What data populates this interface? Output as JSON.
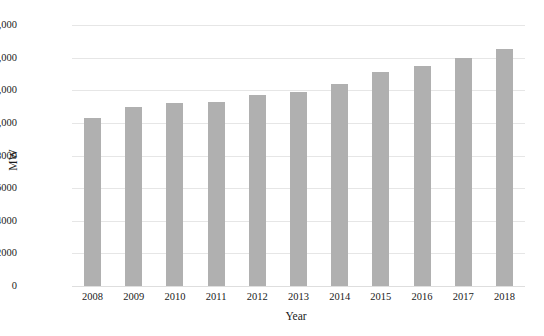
{
  "chart_data": {
    "type": "bar",
    "title": "",
    "xlabel": "Year",
    "ylabel": "MW",
    "categories": [
      "2008",
      "2009",
      "2010",
      "2011",
      "2012",
      "2013",
      "2014",
      "2015",
      "2016",
      "2017",
      "2018"
    ],
    "values": [
      10300,
      11000,
      11200,
      11300,
      11700,
      11900,
      12400,
      13100,
      13500,
      14000,
      14500
    ],
    "series": [
      {
        "name": "MW",
        "values": [
          10300,
          11000,
          11200,
          11300,
          11700,
          11900,
          12400,
          13100,
          13500,
          14000,
          14500
        ]
      }
    ],
    "ylim": [
      0,
      16000
    ],
    "y_ticks": [
      0,
      2000,
      4000,
      6000,
      8000,
      10000,
      12000,
      14000,
      16000
    ],
    "y_tick_labels": [
      "0",
      "2000",
      "4000",
      "6000",
      "8000",
      "10,000",
      "20,000",
      "14,000",
      "16,000"
    ],
    "grid": true,
    "grid_axis": "y",
    "legend": false,
    "legend_position": "none",
    "bar_color": "#b0b0b0",
    "gridline_color": "#e6e6e6",
    "background_color": "#ffffff",
    "text_color": "#1a1a1a",
    "annotations": []
  },
  "axes": {
    "y_title": "MW",
    "x_title": "Year"
  }
}
